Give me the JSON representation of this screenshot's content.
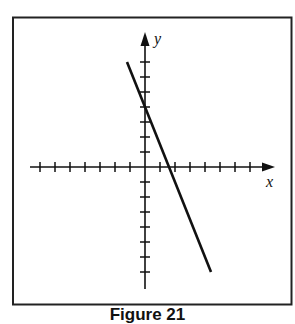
{
  "chart_data": {
    "type": "line",
    "title": "",
    "caption": "Figure 21",
    "xlabel": "x",
    "ylabel": "y",
    "xlim": [
      -7,
      7
    ],
    "ylim": [
      -7,
      7
    ],
    "x_ticks": [
      -7,
      -6,
      -5,
      -4,
      -3,
      -2,
      -1,
      1,
      2,
      3,
      4,
      5,
      6,
      7
    ],
    "y_ticks": [
      -7,
      -6,
      -5,
      -4,
      -3,
      -2,
      -1,
      1,
      2,
      3,
      4,
      5,
      6,
      7
    ],
    "tick_labels_shown": false,
    "grid": false,
    "legend": null,
    "series": [
      {
        "name": "line",
        "equation": "y = -2.5x + 4",
        "slope": -2.5,
        "y_intercept": 4,
        "x_intercept": 1.6,
        "x": [
          -1.2,
          4.4
        ],
        "y": [
          7,
          -7
        ]
      }
    ]
  },
  "labels": {
    "x_axis": "x",
    "y_axis": "y",
    "caption": "Figure 21"
  },
  "colors": {
    "ink": "#111111",
    "frame": "#222222",
    "background": "#ffffff"
  }
}
